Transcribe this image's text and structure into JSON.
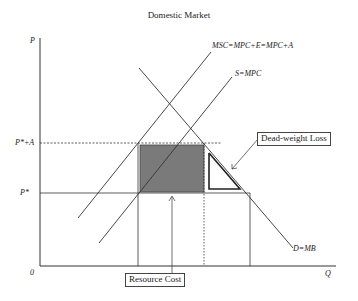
{
  "title": "Domestic Market",
  "axes": {
    "y_label": "P",
    "x_label": "Q",
    "origin": "0",
    "price_high": "P*+A",
    "price_low": "P*"
  },
  "curves": {
    "msc": "MSC=MPC+E=MPC+A",
    "supply": "S=MPC",
    "demand": "D=MB"
  },
  "callouts": {
    "deadweight": "Dead-weight Loss",
    "resource": "Resource Cost"
  },
  "colors": {
    "line": "#333333",
    "shaded": "#7a7a7a",
    "background": "#ffffff"
  }
}
